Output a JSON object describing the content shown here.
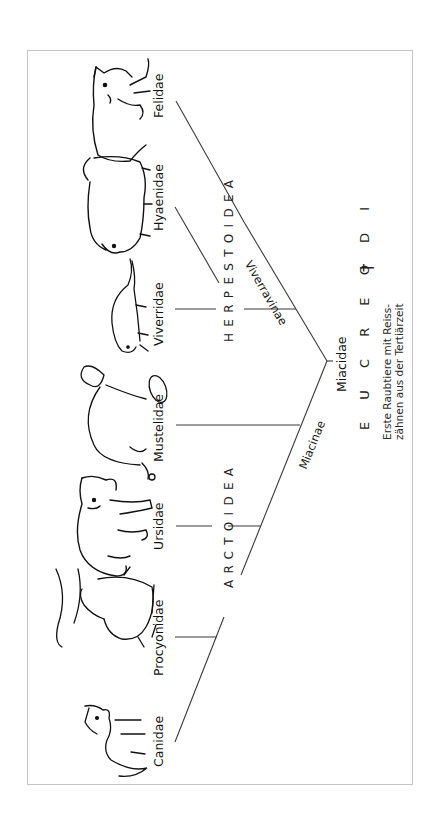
{
  "diagram": {
    "orientation": "rotated-90-ccw",
    "root": {
      "label": "E U C R E O D I",
      "extinct_marker": "†",
      "note_line1": "Erste Raubtiere mit Reiss-",
      "note_line2": "zähnen aus der Tertiärzeit"
    },
    "ancestor": {
      "label": "Miacidae"
    },
    "branches": {
      "miacinae": "Miacinae",
      "viverravinae": "Viverravinae"
    },
    "superfamilies": {
      "arctoidea": "ARCTOIDEA",
      "herpestoidea": "HERPESTOIDEA"
    },
    "families": [
      {
        "name": "Canidae",
        "group": "ARCTOIDEA",
        "animal": "fox-drawing"
      },
      {
        "name": "Procyonidae",
        "group": "ARCTOIDEA",
        "animal": "raccoon-drawing"
      },
      {
        "name": "Ursidae",
        "group": "ARCTOIDEA",
        "animal": "bear-drawing"
      },
      {
        "name": "Mustelidae",
        "group": "ARCTOIDEA",
        "animal": "otter-drawing"
      },
      {
        "name": "Viverridae",
        "group": "HERPESTOIDEA",
        "animal": "civet-drawing"
      },
      {
        "name": "Hyaenidae",
        "group": "HERPESTOIDEA",
        "animal": "hyena-drawing"
      },
      {
        "name": "Felidae",
        "group": "HERPESTOIDEA",
        "animal": "cat-drawing"
      }
    ],
    "colors": {
      "line": "#3a3a3a",
      "frame": "#c4c4c4",
      "ink": "#111111"
    }
  }
}
